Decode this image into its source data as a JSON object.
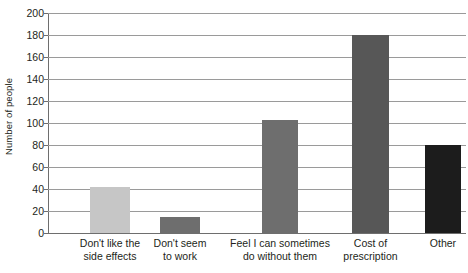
{
  "chart_data": {
    "type": "bar",
    "title": "",
    "subtitle": "",
    "xlabel": "",
    "ylabel": "Number of people",
    "ylim": [
      0,
      200
    ],
    "ytick_step": 20,
    "yticks": [
      200,
      180,
      160,
      140,
      120,
      100,
      80,
      60,
      40,
      20,
      0
    ],
    "ytick_labels": [
      "200",
      "180",
      "160",
      "140",
      "120",
      "100",
      "80",
      "60",
      "40",
      "20",
      "0"
    ],
    "grid": "horizontal",
    "legend": "none",
    "categories": [
      "Don't like the side effects",
      "Don't seem to work",
      "Feel I can sometimes do without them",
      "Cost of prescription",
      "Other"
    ],
    "category_lines": [
      [
        "Don't like the",
        "side effects"
      ],
      [
        "Don't seem",
        "to work"
      ],
      [
        "Feel I can sometimes",
        "do without them"
      ],
      [
        "Cost of",
        "prescription"
      ],
      [
        "Other",
        ""
      ]
    ],
    "values": [
      42,
      15,
      103,
      180,
      80
    ],
    "bar_colors": [
      "#c6c6c6",
      "#6e6e6e",
      "#6e6e6e",
      "#575757",
      "#1c1c1c"
    ],
    "series": [
      {
        "name": "Number of people",
        "values": [
          42,
          15,
          103,
          180,
          80
        ]
      }
    ],
    "axis_color": "#6e6e6e",
    "grid_color": "#9a9a9a",
    "background": "#ffffff"
  }
}
